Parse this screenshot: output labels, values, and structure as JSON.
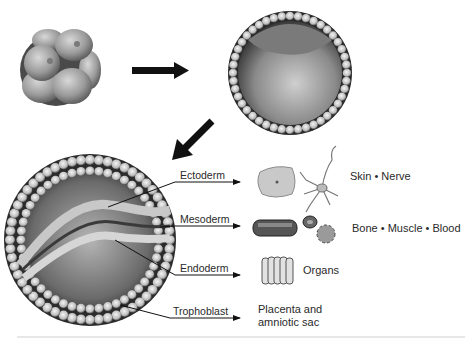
{
  "diagram": {
    "title": "",
    "stages": [
      {
        "id": "morula",
        "label": ""
      },
      {
        "id": "blastocyst",
        "label": ""
      },
      {
        "id": "gastrula",
        "label": ""
      }
    ],
    "germ_layers": [
      {
        "name": "Ectoderm",
        "result": "Skin • Nerve",
        "icons": [
          "skin-cell-icon",
          "nerve-cell-icon"
        ]
      },
      {
        "name": "Mesoderm",
        "result": "Bone • Muscle • Blood",
        "icons": [
          "muscle-cell-icon",
          "blood-cell-icon",
          "bone-cell-icon"
        ]
      },
      {
        "name": "Endoderm",
        "result": "Organs",
        "icons": [
          "organ-cells-icon"
        ]
      },
      {
        "name": "Trophoblast",
        "result_line1": "Placenta and",
        "result_line2": "amniotic sac",
        "icons": []
      }
    ],
    "colors": {
      "arrow": "#111111",
      "text": "#2a2a2a",
      "cell_light": "#e6e6e6",
      "cell_dark": "#3a3a3a",
      "divider": "#cfcfcf"
    }
  }
}
